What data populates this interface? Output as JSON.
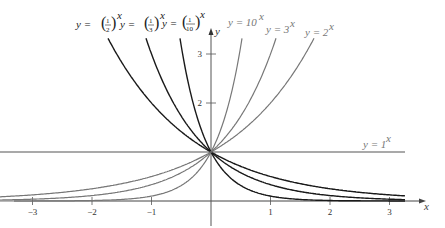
{
  "chart_data": {
    "type": "line",
    "title": "",
    "xlabel": "x",
    "ylabel": "y",
    "xlim": [
      -3.3,
      3.5
    ],
    "ylim": [
      0,
      3.4
    ],
    "grid": false,
    "x_ticks": [
      -3,
      -2,
      -1,
      1,
      2,
      3
    ],
    "x_tick_labels": [
      "−3",
      "−2",
      "−1",
      "1",
      "2",
      "3"
    ],
    "y_ticks": [
      2,
      3
    ],
    "y_tick_labels": [
      "2",
      "3"
    ],
    "series": [
      {
        "name": "y = (1/2)^x",
        "base": 0.5,
        "color": "#1a1a1a",
        "label_pos": [
          32,
          22
        ]
      },
      {
        "name": "y = (1/3)^x",
        "base": 0.3333,
        "color": "#1a1a1a",
        "label_pos": [
          76,
          22
        ]
      },
      {
        "name": "y = (1/10)^x",
        "base": 0.1,
        "color": "#1a1a1a",
        "label_pos": [
          118,
          22
        ]
      },
      {
        "name": "y = 10^x",
        "base": 10,
        "color": "#777777",
        "label_pos": [
          228,
          22
        ]
      },
      {
        "name": "y = 3^x",
        "base": 3,
        "color": "#777777",
        "label_pos": [
          266,
          32
        ]
      },
      {
        "name": "y = 2^x",
        "base": 2,
        "color": "#777777",
        "label_pos": [
          306,
          36
        ]
      },
      {
        "name": "y = 1^x",
        "base": 1,
        "color": "#555555",
        "label_pos": [
          363,
          148
        ]
      }
    ],
    "annotations": [
      "Intersection of all curves at (0, 1)"
    ]
  },
  "labels": {
    "half": {
      "pre": "y = ",
      "num": "1",
      "den": "2",
      "exp": "x"
    },
    "third": {
      "pre": "y = ",
      "num": "1",
      "den": "3",
      "exp": "x"
    },
    "tenth": {
      "pre": "y = ",
      "num": "1",
      "den": "10",
      "exp": "x"
    },
    "ten": {
      "pre": "y = 10",
      "exp": "x"
    },
    "three": {
      "pre": "y = 3",
      "exp": "x"
    },
    "two": {
      "pre": "y = 2",
      "exp": "x"
    },
    "one": {
      "pre": "y = 1",
      "exp": "x"
    },
    "x_axis": "x",
    "y_axis": "y"
  }
}
